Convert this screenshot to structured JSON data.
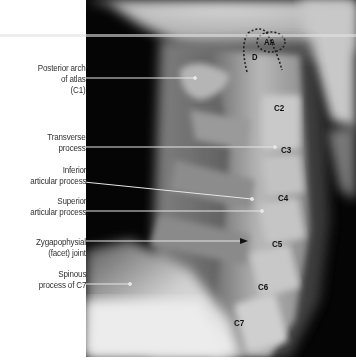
{
  "figure": {
    "annotations_left": [
      {
        "lines": [
          "Posterior arch",
          "of atlas",
          "(C1)"
        ],
        "leader_y": 78,
        "leader_end_x": 195
      },
      {
        "lines": [
          "Transverse",
          "process"
        ],
        "leader_y": 147,
        "leader_end_x": 275
      },
      {
        "lines": [
          "Inferior",
          "articular process"
        ],
        "leader_end_x": 252,
        "leader_end_y": 199
      },
      {
        "lines": [
          "Superior",
          "articular process"
        ],
        "leader_y": 211,
        "leader_end_x": 262
      },
      {
        "lines": [
          "Zygapophysial",
          "(facet) joint"
        ],
        "leader_y": 241,
        "leader_end_x": 247,
        "arrow": true
      },
      {
        "lines": [
          "Spinous",
          "process of C7"
        ],
        "leader_y": 284,
        "leader_end_x": 130
      }
    ],
    "vertebra_labels": [
      "C2",
      "C3",
      "C4",
      "C5",
      "C6",
      "C7"
    ],
    "outline_labels": {
      "dens": "D",
      "anterior_arch": "AA"
    },
    "colors": {
      "background": "#ffffff",
      "label_text": "#333333",
      "leader": "#e8e8e8",
      "xray_dark": "#050505",
      "bone": "#c8c8c8"
    }
  }
}
